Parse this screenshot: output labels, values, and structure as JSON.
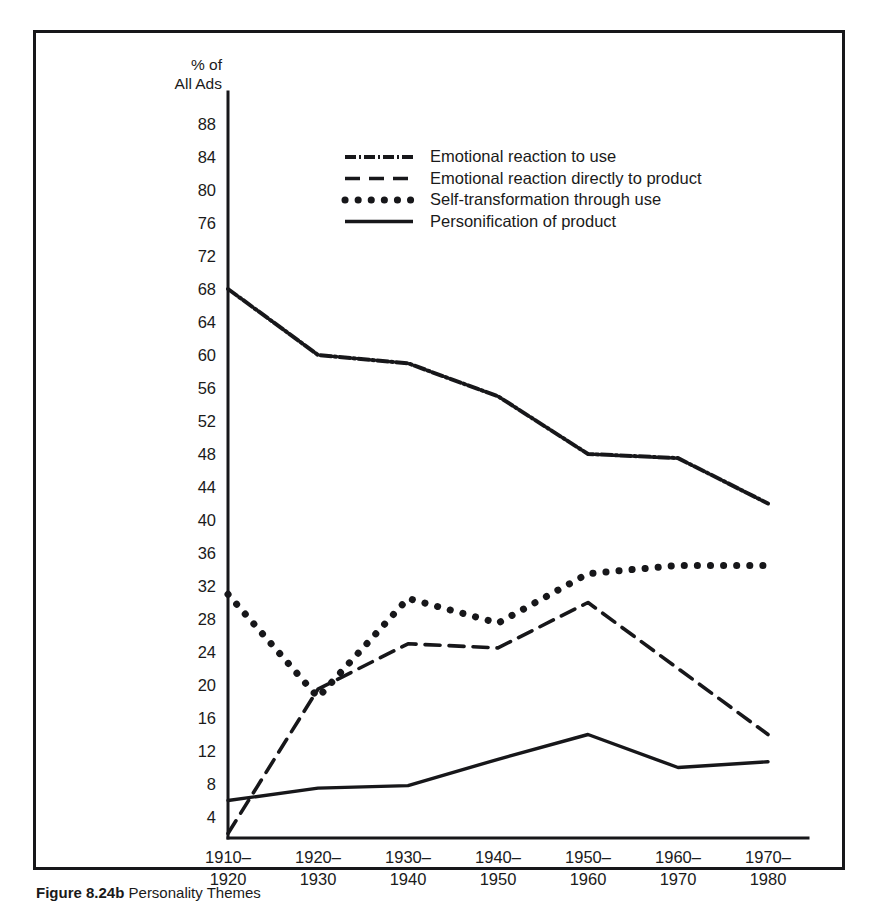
{
  "figure": {
    "caption_number": "Figure 8.24b",
    "caption_text": "Personality Themes"
  },
  "chart_data": {
    "type": "line",
    "title": "",
    "xlabel": "",
    "ylabel": "% of All Ads",
    "ylabel_line1": "% of",
    "ylabel_line2": "All Ads",
    "ylim": [
      0,
      90
    ],
    "ytick_min": 4,
    "ytick_max": 88,
    "ytick_step": 4,
    "yticks": [
      88,
      84,
      80,
      76,
      72,
      68,
      64,
      60,
      56,
      52,
      48,
      44,
      40,
      36,
      32,
      28,
      24,
      20,
      16,
      12,
      8,
      4
    ],
    "grid": false,
    "legend_position": "upper-center",
    "categories": [
      "1910-\n1920",
      "1920-\n1930",
      "1930-\n1940",
      "1940-\n1950",
      "1950-\n1960",
      "1960-\n1970",
      "1970-\n1980"
    ],
    "categories_top": [
      "1910–",
      "1920–",
      "1930–",
      "1940–",
      "1950–",
      "1960–",
      "1970–"
    ],
    "categories_bottom": [
      "1920",
      "1930",
      "1940",
      "1950",
      "1960",
      "1970",
      "1980"
    ],
    "series": [
      {
        "name": "Emotional reaction to use",
        "style": "dash-dot",
        "values": [
          68,
          60,
          59,
          55,
          48,
          47.5,
          42
        ]
      },
      {
        "name": "Emotional reaction directly to product",
        "style": "dashed",
        "values": [
          2,
          19.5,
          25,
          24.5,
          30,
          22,
          14
        ]
      },
      {
        "name": "Self-transformation through use",
        "style": "dotted",
        "values": [
          31,
          18.5,
          30.5,
          27.5,
          33.5,
          34.5,
          34.5
        ]
      },
      {
        "name": "Personification of product",
        "style": "solid",
        "values": [
          6,
          7.5,
          7.8,
          11,
          14,
          10,
          10.7
        ]
      }
    ]
  },
  "legend": {
    "items": [
      {
        "label": "Emotional reaction to use",
        "style": "dash-dot"
      },
      {
        "label": "Emotional reaction directly to product",
        "style": "dashed"
      },
      {
        "label": "Self-transformation through use",
        "style": "dotted"
      },
      {
        "label": "Personification of product",
        "style": "solid"
      }
    ]
  },
  "colors": {
    "ink": "#17171a",
    "background": "#ffffff"
  }
}
